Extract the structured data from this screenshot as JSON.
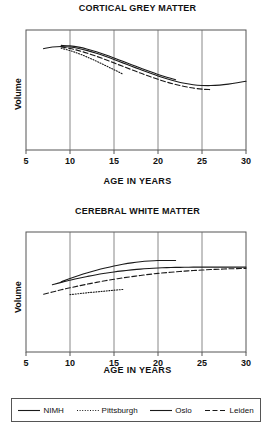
{
  "figure": {
    "xlabel": "AGE IN YEARS",
    "ylabel": "Volume"
  },
  "legend": {
    "items": [
      {
        "label": "NIMH",
        "style": "solid",
        "swatch": "legend-swatch-nimh"
      },
      {
        "label": "Pittsburgh",
        "style": "dotted",
        "swatch": "legend-swatch-pittsburgh"
      },
      {
        "label": "Oslo",
        "style": "solid",
        "swatch": "legend-swatch-oslo"
      },
      {
        "label": "Leiden",
        "style": "dashed",
        "swatch": "legend-swatch-leiden"
      }
    ]
  },
  "ticks": {
    "x": [
      "5",
      "10",
      "15",
      "20",
      "25",
      "30"
    ]
  },
  "chart_data": [
    {
      "type": "line",
      "title": "CORTICAL GREY MATTER",
      "xlabel": "AGE IN YEARS",
      "ylabel": "Volume",
      "xlim": [
        5,
        30
      ],
      "ylim": [
        0,
        1
      ],
      "xticks": [
        5,
        10,
        15,
        20,
        25,
        30
      ],
      "yticks": [],
      "grid": "vertical gridlines at 10, 15, 20, 25",
      "legend_position": "below figure, shared",
      "series": [
        {
          "name": "NIMH",
          "style": "solid",
          "color": "#1a1a1a",
          "x": [
            7,
            8,
            9,
            10,
            11,
            12,
            13,
            14,
            15,
            16,
            17,
            18,
            19,
            20,
            21,
            22,
            23,
            24,
            25,
            26,
            27,
            28,
            29,
            30
          ],
          "y": [
            0.845,
            0.858,
            0.862,
            0.858,
            0.846,
            0.828,
            0.806,
            0.781,
            0.754,
            0.726,
            0.698,
            0.67,
            0.643,
            0.617,
            0.594,
            0.573,
            0.556,
            0.544,
            0.538,
            0.537,
            0.541,
            0.549,
            0.56,
            0.573
          ]
        },
        {
          "name": "Oslo",
          "style": "solid",
          "color": "#1a1a1a",
          "x": [
            9,
            10,
            11,
            12,
            13,
            14,
            15,
            16,
            17,
            18,
            19,
            20,
            21,
            22
          ],
          "y": [
            0.872,
            0.868,
            0.857,
            0.84,
            0.819,
            0.794,
            0.767,
            0.739,
            0.711,
            0.683,
            0.656,
            0.63,
            0.606,
            0.585
          ]
        },
        {
          "name": "Leiden",
          "style": "dashed",
          "color": "#1a1a1a",
          "x": [
            9,
            10,
            11,
            12,
            13,
            14,
            15,
            16,
            17,
            18,
            19,
            20,
            21,
            22,
            23,
            24,
            25,
            26
          ],
          "y": [
            0.858,
            0.846,
            0.828,
            0.806,
            0.781,
            0.754,
            0.726,
            0.697,
            0.669,
            0.641,
            0.614,
            0.589,
            0.566,
            0.546,
            0.529,
            0.516,
            0.507,
            0.503
          ]
        },
        {
          "name": "Pittsburgh",
          "style": "dotted",
          "color": "#1a1a1a",
          "x": [
            9,
            10,
            11,
            12,
            13,
            14,
            15,
            16
          ],
          "y": [
            0.848,
            0.828,
            0.803,
            0.773,
            0.74,
            0.705,
            0.669,
            0.633
          ]
        }
      ]
    },
    {
      "type": "line",
      "title": "CEREBRAL WHITE MATTER",
      "xlabel": "AGE IN YEARS",
      "ylabel": "Volume",
      "xlim": [
        5,
        30
      ],
      "ylim": [
        0,
        1
      ],
      "xticks": [
        5,
        10,
        15,
        20,
        25,
        30
      ],
      "yticks": [],
      "grid": "vertical gridlines at 10, 15, 20, 25",
      "legend_position": "below figure, shared",
      "series": [
        {
          "name": "NIMH",
          "style": "solid",
          "color": "#1a1a1a",
          "x": [
            8,
            9,
            10,
            11,
            12,
            13,
            14,
            15,
            16,
            17,
            18,
            19,
            20,
            21,
            22,
            23,
            24,
            25,
            26,
            27,
            28,
            29,
            30
          ],
          "y": [
            0.56,
            0.58,
            0.598,
            0.615,
            0.63,
            0.644,
            0.656,
            0.667,
            0.676,
            0.684,
            0.691,
            0.696,
            0.7,
            0.703,
            0.705,
            0.706,
            0.707,
            0.707,
            0.707,
            0.707,
            0.707,
            0.707,
            0.707
          ]
        },
        {
          "name": "Oslo",
          "style": "solid",
          "color": "#1a1a1a",
          "x": [
            9,
            10,
            11,
            12,
            13,
            14,
            15,
            16,
            17,
            18,
            19,
            20,
            21,
            22
          ],
          "y": [
            0.585,
            0.612,
            0.637,
            0.66,
            0.681,
            0.7,
            0.717,
            0.731,
            0.743,
            0.752,
            0.758,
            0.762,
            0.763,
            0.762
          ]
        },
        {
          "name": "Leiden",
          "style": "dashed",
          "color": "#1a1a1a",
          "x": [
            7,
            8,
            9,
            10,
            11,
            12,
            13,
            14,
            15,
            16,
            17,
            18,
            19,
            20,
            21,
            22,
            23,
            24,
            25,
            26,
            27,
            28,
            29,
            30
          ],
          "y": [
            0.482,
            0.5,
            0.518,
            0.535,
            0.551,
            0.566,
            0.58,
            0.594,
            0.606,
            0.618,
            0.628,
            0.638,
            0.647,
            0.655,
            0.662,
            0.668,
            0.674,
            0.679,
            0.683,
            0.687,
            0.69,
            0.693,
            0.695,
            0.697
          ]
        },
        {
          "name": "Pittsburgh",
          "style": "dotted",
          "color": "#1a1a1a",
          "x": [
            10,
            11,
            12,
            13,
            14,
            15,
            16
          ],
          "y": [
            0.478,
            0.486,
            0.494,
            0.501,
            0.508,
            0.515,
            0.521
          ]
        }
      ]
    }
  ]
}
